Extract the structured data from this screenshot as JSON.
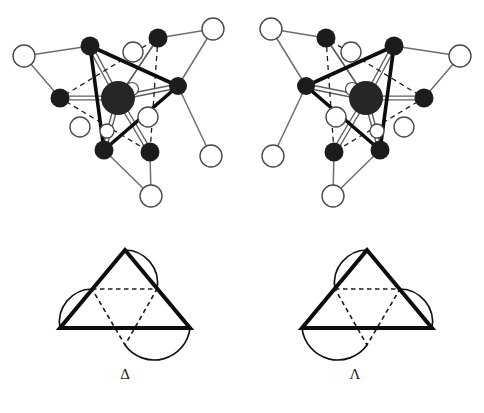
{
  "figure": {
    "caption": "",
    "background_color": "#ffffff"
  },
  "palette": {
    "metal_center": "#262626",
    "donor_atom": "#1c1c1c",
    "outer_atom_fill": "#ffffff",
    "outer_atom_stroke": "#4a4a4a",
    "bond_solid": "#0d0d0d",
    "bond_tube": "#6e6e6e",
    "bond_dashed": "#1a1a1a",
    "label_color": "#1a1a1a"
  },
  "panels": [
    {
      "id": "delta-3d",
      "name": "delta-enantiomer-structure",
      "kind": "ball-and-stick",
      "chirality": "Delta"
    },
    {
      "id": "lambda-3d",
      "name": "lambda-enantiomer-structure",
      "kind": "ball-and-stick",
      "chirality": "Lambda"
    },
    {
      "id": "delta-schematic",
      "name": "delta-triangle-schematic",
      "kind": "schematic",
      "chirality": "Delta"
    },
    {
      "id": "lambda-schematic",
      "name": "lambda-triangle-schematic",
      "kind": "schematic",
      "chirality": "Lambda"
    }
  ],
  "labels": {
    "delta": "Δ",
    "lambda": "Λ"
  },
  "structure": {
    "metal_radius": 17,
    "donor_radius": 9.5,
    "outer_radius": 11,
    "delta": {
      "metal": [
        118,
        98
      ],
      "donors": [
        [
          90,
          46
        ],
        [
          158,
          38
        ],
        [
          178,
          86
        ],
        [
          150,
          152
        ],
        [
          104,
          150
        ],
        [
          60,
          98
        ]
      ],
      "outer": [
        [
          24,
          56
        ],
        [
          213,
          29
        ],
        [
          211,
          156
        ],
        [
          151,
          196
        ],
        [
          133,
          52
        ],
        [
          80,
          127
        ]
      ],
      "chelate_pairs": [
        [
          0,
          5
        ],
        [
          1,
          2
        ],
        [
          3,
          4
        ]
      ],
      "outer_links": [
        [
          0,
          0
        ],
        [
          5,
          0
        ],
        [
          1,
          1
        ],
        [
          2,
          1
        ],
        [
          3,
          2
        ],
        [
          3,
          3
        ],
        [
          4,
          3
        ]
      ],
      "solid_face": [
        [
          90,
          46
        ],
        [
          178,
          86
        ],
        [
          104,
          150
        ]
      ],
      "dashed_face": [
        [
          158,
          38
        ],
        [
          150,
          152
        ],
        [
          60,
          98
        ]
      ]
    },
    "lambda": {
      "metal": [
        124,
        98
      ],
      "donors": [
        [
          152,
          46
        ],
        [
          84,
          38
        ],
        [
          64,
          86
        ],
        [
          92,
          152
        ],
        [
          138,
          150
        ],
        [
          182,
          98
        ]
      ],
      "outer": [
        [
          218,
          56
        ],
        [
          29,
          29
        ],
        [
          31,
          156
        ],
        [
          91,
          196
        ],
        [
          109,
          52
        ],
        [
          162,
          127
        ]
      ],
      "chelate_pairs": [
        [
          0,
          5
        ],
        [
          1,
          2
        ],
        [
          3,
          4
        ]
      ],
      "outer_links": [
        [
          0,
          0
        ],
        [
          5,
          0
        ],
        [
          1,
          1
        ],
        [
          2,
          1
        ],
        [
          3,
          2
        ],
        [
          3,
          3
        ],
        [
          4,
          3
        ]
      ],
      "solid_face": [
        [
          152,
          46
        ],
        [
          64,
          86
        ],
        [
          138,
          150
        ]
      ],
      "dashed_face": [
        [
          84,
          38
        ],
        [
          92,
          152
        ],
        [
          182,
          98
        ]
      ]
    }
  },
  "schematic": {
    "triangle": [
      [
        85,
        18
      ],
      [
        20,
        96
      ],
      [
        150,
        96
      ]
    ],
    "inner_dashed": [
      [
        52,
        57
      ],
      [
        117,
        57
      ],
      [
        85,
        113
      ]
    ],
    "stroke_width_triangle": 4,
    "stroke_width_dashed": 1.6
  }
}
